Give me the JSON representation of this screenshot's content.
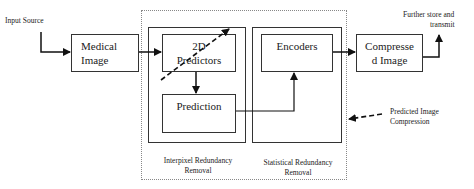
{
  "diagram": {
    "input_label": "Input Source",
    "output_label_line1": "Further store and",
    "output_label_line2": "transmit",
    "nodes": {
      "medical_image": {
        "line1": "Medical",
        "line2": "Image"
      },
      "predictors_2d": {
        "line1": "2D",
        "line2": "Predictors"
      },
      "prediction": {
        "label": "Prediction"
      },
      "encoders": {
        "label": "Encoders"
      },
      "compressed_image": {
        "line1": "Compresse",
        "line2": "d Image"
      }
    },
    "groups": {
      "interpixel": {
        "line1": "Interpixel Redundancy",
        "line2": "Removal"
      },
      "statistical": {
        "line1": "Statistical Redundancy",
        "line2": "Removal"
      }
    },
    "annotation": {
      "line1": "Predicted Image",
      "line2": "Compression"
    }
  }
}
